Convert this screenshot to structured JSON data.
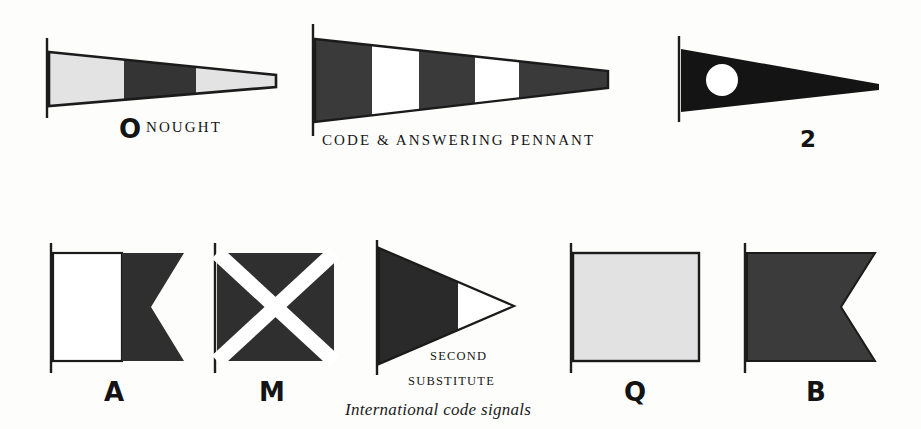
{
  "plate": {
    "caption": "International code signals",
    "background_color": "#fdfdfc",
    "ink_color": "#2e2e2e",
    "light_color": "#e3e3e3",
    "white_color": "#ffffff"
  },
  "top_row": [
    {
      "id": "pennant-nought",
      "shape": "tapered-pennant-truncated",
      "glyph": "O",
      "name": "NOUGHT",
      "bands": [
        {
          "color": "#e3e3e3",
          "label": "light"
        },
        {
          "color": "#343434",
          "label": "dark"
        },
        {
          "color": "#e3e3e3",
          "label": "light"
        }
      ]
    },
    {
      "id": "pennant-code-answering",
      "shape": "tapered-pennant-truncated",
      "glyph": "",
      "name": "CODE & ANSWERING PENNANT",
      "bands": [
        {
          "color": "#3a3a3a",
          "label": "dark"
        },
        {
          "color": "#ffffff",
          "label": "white"
        },
        {
          "color": "#3a3a3a",
          "label": "dark"
        },
        {
          "color": "#ffffff",
          "label": "white"
        },
        {
          "color": "#3a3a3a",
          "label": "dark"
        }
      ]
    },
    {
      "id": "pennant-two",
      "shape": "tapered-pennant-pointed",
      "glyph": "2",
      "name": "",
      "field_color": "#141414",
      "disc_color": "#ffffff"
    }
  ],
  "bottom_row": [
    {
      "id": "flag-a",
      "shape": "swallowtail",
      "glyph": "A",
      "name": "",
      "hoist_color": "#ffffff",
      "fly_color": "#2f2f2f"
    },
    {
      "id": "flag-m",
      "shape": "square-saltire",
      "glyph": "M",
      "name": "",
      "field_color": "#2f2f2f",
      "saltire_color": "#ffffff"
    },
    {
      "id": "pennant-second-substitute",
      "shape": "triangle-pennant",
      "glyph": "",
      "name_line1": "SECOND",
      "name_line2": "SUBSTITUTE",
      "hoist_color": "#2a2a2a",
      "fly_color": "#ffffff"
    },
    {
      "id": "flag-q",
      "shape": "square",
      "glyph": "Q",
      "name": "",
      "field_color": "#e2e2e2"
    },
    {
      "id": "flag-b",
      "shape": "swallowtail",
      "glyph": "B",
      "name": "",
      "field_color": "#3b3b3b"
    }
  ]
}
